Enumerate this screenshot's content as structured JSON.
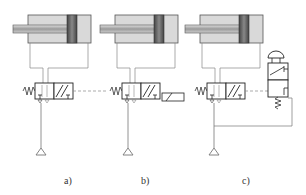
{
  "diagram": {
    "panels": [
      {
        "id": "a",
        "label": "a)",
        "description": "Double-acting cylinder controlled by 5/2 valve, spring return, pilot actuated"
      },
      {
        "id": "b",
        "label": "b)",
        "description": "Double-acting cylinder controlled by 5/2 valve, spring return, solenoid actuated"
      },
      {
        "id": "c",
        "label": "c)",
        "description": "Double-acting cylinder controlled by 5/2 valve, piloted by push-button 3/2 valve"
      }
    ],
    "colors": {
      "line": "#777777",
      "cylinder_body": "#d6d6d6",
      "piston": "#555555",
      "rod": "#bdbdbd",
      "outline": "#222222"
    }
  }
}
